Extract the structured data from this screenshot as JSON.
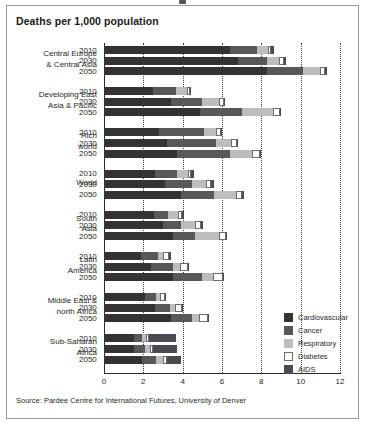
{
  "figure": {
    "title": "Deaths per 1,000 population",
    "source": "Source: Pardee Centre for International Futures, University of Denver"
  },
  "legend": {
    "position": "bottom-right",
    "items": [
      {
        "label": "Cardiovascular",
        "color": "#333333",
        "key": "cardiovascular"
      },
      {
        "label": "Cancer",
        "color": "#58585a",
        "key": "cancer"
      },
      {
        "label": "Respiratory",
        "color": "#bdbdbd",
        "key": "respiratory"
      },
      {
        "label": "Diabetes",
        "color": "#ffffff",
        "key": "diabetes"
      },
      {
        "label": "AIDS",
        "color": "#4a4a52",
        "key": "aids"
      }
    ]
  },
  "chart_data": {
    "type": "bar",
    "orientation": "horizontal",
    "stacked": true,
    "title": "Deaths per 1,000 population",
    "xlabel": "",
    "ylabel": "",
    "xlim": [
      0,
      12
    ],
    "xticks": [
      0,
      2,
      4,
      6,
      8,
      10,
      12
    ],
    "xtick_labels": [
      "0",
      "2",
      "4",
      "6",
      "8",
      "10",
      "12"
    ],
    "grid": "vertical-dotted",
    "series_names": [
      "Cardiovascular",
      "Cancer",
      "Respiratory",
      "Diabetes",
      "AIDS"
    ],
    "group_labels": [
      "Central Europe & Central Asia",
      "Developing East Asia & Pacific",
      "Rich world",
      "World",
      "South Asia",
      "Latin America",
      "Middle East & north Africa",
      "Sub-Saharan Africa"
    ],
    "year_labels": [
      "2010",
      "2030",
      "2050"
    ],
    "groups": [
      {
        "label_line1": "Central Europe",
        "label_line2": "& Central Asia",
        "bars": [
          {
            "year": "2010",
            "values": {
              "cardiovascular": 6.4,
              "cancer": 1.4,
              "respiratory": 0.55,
              "diabetes": 0.15,
              "aids": 0.15
            },
            "total": 8.65
          },
          {
            "year": "2030",
            "values": {
              "cardiovascular": 6.8,
              "cancer": 1.5,
              "respiratory": 0.6,
              "diabetes": 0.25,
              "aids": 0.1
            },
            "total": 9.25
          },
          {
            "year": "2050",
            "values": {
              "cardiovascular": 8.3,
              "cancer": 1.8,
              "respiratory": 0.9,
              "diabetes": 0.25,
              "aids": 0.1
            },
            "total": 11.35
          }
        ]
      },
      {
        "label_line1": "Developing East",
        "label_line2": "Asia & Pacific",
        "bars": [
          {
            "year": "2010",
            "values": {
              "cardiovascular": 2.5,
              "cancer": 1.15,
              "respiratory": 0.55,
              "diabetes": 0.15,
              "aids": 0.05
            },
            "total": 4.4
          },
          {
            "year": "2030",
            "values": {
              "cardiovascular": 3.4,
              "cancer": 1.6,
              "respiratory": 0.85,
              "diabetes": 0.25,
              "aids": 0.05
            },
            "total": 6.15
          },
          {
            "year": "2050",
            "values": {
              "cardiovascular": 4.9,
              "cancer": 2.1,
              "respiratory": 1.6,
              "diabetes": 0.35,
              "aids": 0.05
            },
            "total": 9.0
          }
        ]
      },
      {
        "label_line1": "Rich",
        "label_line2": "world",
        "bars": [
          {
            "year": "2010",
            "values": {
              "cardiovascular": 2.8,
              "cancer": 2.3,
              "respiratory": 0.6,
              "diabetes": 0.25,
              "aids": 0.03
            },
            "total": 5.98
          },
          {
            "year": "2030",
            "values": {
              "cardiovascular": 3.2,
              "cancer": 2.5,
              "respiratory": 0.75,
              "diabetes": 0.3,
              "aids": 0.03
            },
            "total": 6.78
          },
          {
            "year": "2050",
            "values": {
              "cardiovascular": 3.7,
              "cancer": 2.7,
              "respiratory": 1.15,
              "diabetes": 0.4,
              "aids": 0.03
            },
            "total": 7.98
          }
        ]
      },
      {
        "label_line1": "World",
        "label_line2": "",
        "bars": [
          {
            "year": "2010",
            "values": {
              "cardiovascular": 2.6,
              "cancer": 1.1,
              "respiratory": 0.55,
              "diabetes": 0.15,
              "aids": 0.2
            },
            "total": 4.6
          },
          {
            "year": "2030",
            "values": {
              "cardiovascular": 3.1,
              "cancer": 1.4,
              "respiratory": 0.7,
              "diabetes": 0.25,
              "aids": 0.15
            },
            "total": 5.6
          },
          {
            "year": "2050",
            "values": {
              "cardiovascular": 3.9,
              "cancer": 1.7,
              "respiratory": 1.1,
              "diabetes": 0.3,
              "aids": 0.1
            },
            "total": 7.1
          }
        ]
      },
      {
        "label_line1": "South",
        "label_line2": "Asia",
        "bars": [
          {
            "year": "2010",
            "values": {
              "cardiovascular": 2.55,
              "cancer": 0.7,
              "respiratory": 0.5,
              "diabetes": 0.2,
              "aids": 0.1
            },
            "total": 4.05
          },
          {
            "year": "2030",
            "values": {
              "cardiovascular": 3.0,
              "cancer": 0.9,
              "respiratory": 0.75,
              "diabetes": 0.3,
              "aids": 0.08
            },
            "total": 5.03
          },
          {
            "year": "2050",
            "values": {
              "cardiovascular": 3.5,
              "cancer": 1.15,
              "respiratory": 1.2,
              "diabetes": 0.35,
              "aids": 0.05
            },
            "total": 6.25
          }
        ]
      },
      {
        "label_line1": "Latin",
        "label_line2": "America",
        "bars": [
          {
            "year": "2010",
            "values": {
              "cardiovascular": 1.9,
              "cancer": 0.85,
              "respiratory": 0.25,
              "diabetes": 0.3,
              "aids": 0.1
            },
            "total": 3.4
          },
          {
            "year": "2030",
            "values": {
              "cardiovascular": 2.4,
              "cancer": 1.1,
              "respiratory": 0.35,
              "diabetes": 0.4,
              "aids": 0.08
            },
            "total": 4.33
          },
          {
            "year": "2050",
            "values": {
              "cardiovascular": 3.5,
              "cancer": 1.5,
              "respiratory": 0.55,
              "diabetes": 0.5,
              "aids": 0.05
            },
            "total": 6.1
          }
        ]
      },
      {
        "label_line1": "Middle East &",
        "label_line2": "north Africa",
        "bars": [
          {
            "year": "2010",
            "values": {
              "cardiovascular": 2.1,
              "cancer": 0.55,
              "respiratory": 0.2,
              "diabetes": 0.25,
              "aids": 0.03
            },
            "total": 3.13
          },
          {
            "year": "2030",
            "values": {
              "cardiovascular": 2.6,
              "cancer": 0.75,
              "respiratory": 0.25,
              "diabetes": 0.35,
              "aids": 0.03
            },
            "total": 3.98
          },
          {
            "year": "2050",
            "values": {
              "cardiovascular": 3.4,
              "cancer": 1.05,
              "respiratory": 0.4,
              "diabetes": 0.45,
              "aids": 0.03
            },
            "total": 5.33
          }
        ]
      },
      {
        "label_line1": "Sub-Saharan",
        "label_line2": "Africa",
        "bars": [
          {
            "year": "2010",
            "values": {
              "cardiovascular": 1.5,
              "cancer": 0.45,
              "respiratory": 0.2,
              "diabetes": 0.12,
              "aids": 1.4
            },
            "total": 3.67
          },
          {
            "year": "2030",
            "values": {
              "cardiovascular": 1.55,
              "cancer": 0.55,
              "respiratory": 0.25,
              "diabetes": 0.15,
              "aids": 1.2
            },
            "total": 3.7
          },
          {
            "year": "2050",
            "values": {
              "cardiovascular": 1.95,
              "cancer": 0.7,
              "respiratory": 0.35,
              "diabetes": 0.2,
              "aids": 0.7
            },
            "total": 3.9
          }
        ]
      }
    ]
  }
}
